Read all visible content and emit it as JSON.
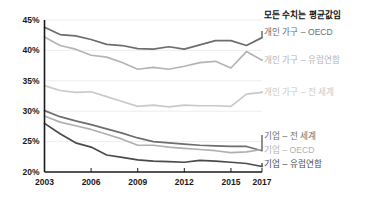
{
  "chart_data": {
    "type": "line",
    "title": "모든 수치는 평균값임",
    "xlabel": "",
    "ylabel": "",
    "x": [
      2003,
      2004,
      2005,
      2006,
      2007,
      2008,
      2009,
      2010,
      2011,
      2012,
      2013,
      2014,
      2015,
      2016,
      2017
    ],
    "xlim": [
      2003,
      2017
    ],
    "ylim": [
      20,
      45
    ],
    "xticks": [
      "2003",
      "2006",
      "2009",
      "2012",
      "2015",
      "2017"
    ],
    "xtick_values": [
      2003,
      2006,
      2009,
      2012,
      2015,
      2017
    ],
    "yticks": [
      "45%",
      "40%",
      "35%",
      "30%",
      "25%",
      "20%"
    ],
    "ytick_values": [
      45,
      40,
      35,
      30,
      25,
      20
    ],
    "grid": true,
    "legend_position": "right",
    "series": [
      {
        "name": "개인 가구 – OECD",
        "color": "#6d6d6d",
        "values": [
          43.8,
          42.6,
          42.4,
          41.8,
          41.0,
          40.8,
          40.3,
          40.2,
          40.6,
          40.2,
          40.9,
          41.6,
          41.6,
          40.8,
          42.1
        ]
      },
      {
        "name": "개인 가구 – 유럽연합",
        "color": "#b4b4b4",
        "values": [
          42.2,
          40.8,
          40.2,
          39.2,
          38.9,
          38.0,
          36.9,
          37.2,
          36.9,
          37.4,
          38.0,
          38.2,
          37.1,
          39.8,
          38.4
        ]
      },
      {
        "name": "개인 가구 – 전 세계",
        "color": "#c9c9c9",
        "values": [
          34.2,
          33.4,
          33.1,
          33.2,
          32.4,
          31.6,
          30.8,
          31.0,
          30.7,
          31.0,
          30.9,
          30.9,
          30.8,
          32.8,
          33.1
        ]
      },
      {
        "name": "기업 – 전 세계",
        "color": "#6d6d6d",
        "values": [
          30.1,
          29.1,
          28.4,
          27.8,
          27.1,
          26.4,
          25.6,
          25.0,
          24.8,
          24.6,
          24.4,
          24.3,
          24.2,
          24.2,
          23.5
        ]
      },
      {
        "name": "기업 – OECD",
        "color": "#b0b0b0",
        "values": [
          29.2,
          28.2,
          27.6,
          27.0,
          26.2,
          25.4,
          24.4,
          24.4,
          24.1,
          23.9,
          23.7,
          23.5,
          23.2,
          23.3,
          23.7
        ]
      },
      {
        "name": "기업 – 유럽연합",
        "color": "#4a4a4a",
        "values": [
          28.0,
          26.3,
          24.8,
          24.1,
          22.8,
          22.4,
          22.0,
          21.8,
          21.7,
          21.6,
          21.9,
          21.8,
          21.6,
          21.4,
          20.9
        ]
      }
    ]
  },
  "legend": {
    "note": "모든 수치는 평균값임",
    "items": [
      {
        "label": "개인 가구 – OECD"
      },
      {
        "label": "개인 가구 – 유럽연합"
      },
      {
        "label": "개인 가구 – 전 세계"
      },
      {
        "label": "기업 – 전 세계"
      },
      {
        "label": "기업 – OECD"
      },
      {
        "label": "기업 – 유럽연합"
      }
    ]
  }
}
